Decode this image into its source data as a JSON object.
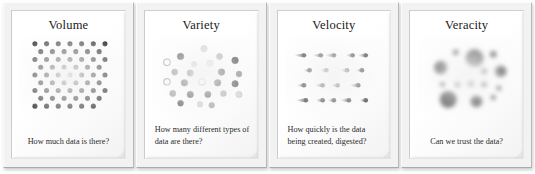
{
  "figure": {
    "background_color": "#ffffff",
    "panel_face_color": "#f5f5f5",
    "ink_color": "#000000"
  },
  "panels": [
    {
      "id": "volume",
      "title": "Volume",
      "caption": "How much data is there?",
      "caption_align": "center",
      "viz_kind": "dot-grid",
      "viz_description": "Dense staggered grid of uniform solid black dots"
    },
    {
      "id": "variety",
      "title": "Variety",
      "caption": "How many different types of data are there?",
      "caption_align": "left",
      "viz_kind": "dot-scatter-multicolor",
      "viz_description": "Scattered dots in assorted grey shades, some hollow with grey outlines"
    },
    {
      "id": "velocity",
      "title": "Velocity",
      "caption": "How quickly is the data being created, digested?",
      "caption_align": "left",
      "viz_kind": "dot-motion-streaks",
      "viz_description": "Rows of black dots trailing tapered motion-blur streaks to the left"
    },
    {
      "id": "veracity",
      "title": "Veracity",
      "caption": "Can we trust the data?",
      "caption_align": "center",
      "viz_kind": "dot-blur-cluster",
      "viz_description": "Cluster of soft, blurred black dots of varying sizes"
    }
  ],
  "chart_data": {
    "type": "scatter",
    "xlabel": "",
    "ylabel": "",
    "grid": false,
    "legend": "none",
    "panels": [
      {
        "name": "Volume",
        "type": "dot-grid",
        "marker": "filled-circle",
        "marker_radius": 2.6,
        "color": "#000000",
        "rows": 9,
        "columns": 7,
        "stagger": true,
        "count": 59,
        "points": [
          [
            8,
            4
          ],
          [
            20,
            4
          ],
          [
            32,
            4
          ],
          [
            44,
            4
          ],
          [
            56,
            4
          ],
          [
            68,
            4
          ],
          [
            80,
            4
          ],
          [
            14,
            12
          ],
          [
            26,
            12
          ],
          [
            38,
            12
          ],
          [
            50,
            12
          ],
          [
            62,
            12
          ],
          [
            74,
            12
          ],
          [
            8,
            20
          ],
          [
            20,
            20
          ],
          [
            32,
            20
          ],
          [
            44,
            20
          ],
          [
            56,
            20
          ],
          [
            68,
            20
          ],
          [
            80,
            20
          ],
          [
            14,
            28
          ],
          [
            26,
            28
          ],
          [
            38,
            28
          ],
          [
            50,
            28
          ],
          [
            62,
            28
          ],
          [
            74,
            28
          ],
          [
            8,
            36
          ],
          [
            20,
            36
          ],
          [
            32,
            36
          ],
          [
            44,
            36
          ],
          [
            56,
            36
          ],
          [
            68,
            36
          ],
          [
            80,
            36
          ],
          [
            14,
            44
          ],
          [
            26,
            44
          ],
          [
            38,
            44
          ],
          [
            50,
            44
          ],
          [
            62,
            44
          ],
          [
            74,
            44
          ],
          [
            8,
            52
          ],
          [
            20,
            52
          ],
          [
            32,
            52
          ],
          [
            44,
            52
          ],
          [
            56,
            52
          ],
          [
            68,
            52
          ],
          [
            80,
            52
          ],
          [
            14,
            60
          ],
          [
            26,
            60
          ],
          [
            38,
            60
          ],
          [
            50,
            60
          ],
          [
            62,
            60
          ],
          [
            74,
            60
          ],
          [
            8,
            68
          ],
          [
            20,
            68
          ],
          [
            32,
            68
          ],
          [
            44,
            68
          ],
          [
            56,
            68
          ],
          [
            68,
            68
          ]
        ]
      },
      {
        "name": "Variety",
        "type": "dot-scatter",
        "marker": "circle",
        "count": 24,
        "shades": [
          "#000000",
          "#3f3f3f",
          "#6e6e6e",
          "#9a9a9a",
          "#c2c2c2",
          "#ffffff"
        ],
        "points": [
          [
            44,
            6,
            3.2,
            "#c6c6c6",
            "#9a9a9a"
          ],
          [
            20,
            14,
            3.4,
            "#1a1a1a",
            "#1a1a1a"
          ],
          [
            60,
            14,
            3.2,
            "#8f8f8f",
            "#8f8f8f"
          ],
          [
            6,
            20,
            3.4,
            "#ffffff",
            "#8a8a8a"
          ],
          [
            34,
            22,
            3.0,
            "#b4b4b4",
            "#b4b4b4"
          ],
          [
            50,
            21,
            3.3,
            "#d2d2d2",
            "#9e9e9e"
          ],
          [
            76,
            18,
            3.4,
            "#141414",
            "#141414"
          ],
          [
            14,
            30,
            3.2,
            "#6a6a6a",
            "#6a6a6a"
          ],
          [
            30,
            31,
            3.3,
            "#1c1c1c",
            "#1c1c1c"
          ],
          [
            62,
            30,
            3.4,
            "#101010",
            "#101010"
          ],
          [
            80,
            32,
            3.0,
            "#5d5d5d",
            "#5d5d5d"
          ],
          [
            6,
            40,
            3.3,
            "#ffffff",
            "#8a8a8a"
          ],
          [
            24,
            41,
            3.4,
            "#161616",
            "#161616"
          ],
          [
            42,
            40,
            3.2,
            "#ffffff",
            "#7d7d7d"
          ],
          [
            58,
            41,
            3.4,
            "#0d0d0d",
            "#0d0d0d"
          ],
          [
            76,
            42,
            3.3,
            "#151515",
            "#151515"
          ],
          [
            12,
            52,
            3.2,
            "#7b7b7b",
            "#7b7b7b"
          ],
          [
            30,
            53,
            3.3,
            "#121212",
            "#121212"
          ],
          [
            48,
            53,
            3.2,
            "#171717",
            "#171717"
          ],
          [
            64,
            52,
            3.1,
            "#8e8e8e",
            "#8e8e8e"
          ],
          [
            80,
            53,
            3.2,
            "#c8c8c8",
            "#9b9b9b"
          ],
          [
            20,
            62,
            3.0,
            "#2a2a2a",
            "#2a2a2a"
          ],
          [
            40,
            63,
            3.0,
            "#b9b9b9",
            "#b9b9b9"
          ],
          [
            52,
            64,
            2.9,
            "#7f7f7f",
            "#7f7f7f"
          ]
        ]
      },
      {
        "name": "Velocity",
        "type": "dot-streak",
        "color": "#000000",
        "rows": 4,
        "count": 20,
        "direction": "rightward",
        "points": [
          [
            10,
            8,
            11
          ],
          [
            28,
            8,
            9
          ],
          [
            42,
            8,
            10
          ],
          [
            62,
            8,
            8
          ],
          [
            76,
            8,
            9
          ],
          [
            16,
            24,
            7
          ],
          [
            34,
            24,
            7
          ],
          [
            56,
            24,
            8
          ],
          [
            72,
            24,
            7
          ],
          [
            10,
            40,
            8
          ],
          [
            30,
            40,
            9
          ],
          [
            46,
            40,
            8
          ],
          [
            68,
            40,
            10
          ],
          [
            12,
            56,
            11
          ],
          [
            30,
            56,
            8
          ],
          [
            42,
            56,
            7
          ],
          [
            58,
            56,
            10
          ],
          [
            76,
            56,
            7
          ]
        ]
      },
      {
        "name": "Veracity",
        "type": "dot-blur",
        "color": "#000000",
        "count": 14,
        "points": [
          [
            30,
            10,
            3.0,
            1.6
          ],
          [
            50,
            16,
            9.5,
            4.0
          ],
          [
            70,
            12,
            3.4,
            1.8
          ],
          [
            14,
            26,
            7.0,
            3.2
          ],
          [
            78,
            30,
            6.0,
            2.8
          ],
          [
            60,
            30,
            3.0,
            1.6
          ],
          [
            16,
            44,
            2.6,
            1.4
          ],
          [
            32,
            44,
            2.8,
            1.5
          ],
          [
            46,
            43,
            3.0,
            1.6
          ],
          [
            60,
            44,
            2.8,
            1.5
          ],
          [
            76,
            48,
            2.6,
            1.4
          ],
          [
            22,
            60,
            9.0,
            3.8
          ],
          [
            52,
            62,
            6.2,
            2.8
          ],
          [
            70,
            58,
            2.6,
            1.4
          ]
        ]
      }
    ]
  }
}
